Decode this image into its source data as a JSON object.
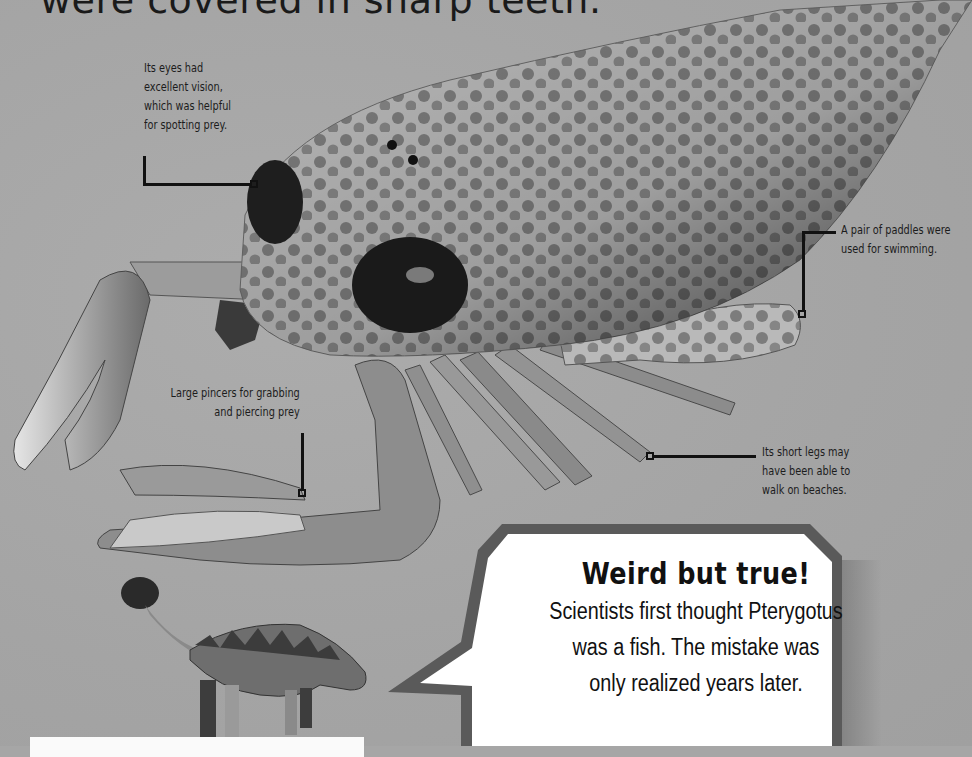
{
  "page": {
    "title_fragment": "were covered in sharp teeth.",
    "background_color": "#a6a6a6"
  },
  "illustration": {
    "subject": "Pterygotus sea scorpion",
    "secondary_subject": "armored dinosaur (ankylosaur)"
  },
  "callouts": [
    {
      "id": "eyes",
      "lines": [
        "Its eyes had",
        "excellent vision,",
        "which was helpful",
        "for spotting prey."
      ]
    },
    {
      "id": "paddles",
      "lines": [
        "A pair of paddles were",
        "used for swimming."
      ]
    },
    {
      "id": "pincers",
      "lines": [
        "Large pincers for grabbing",
        "and piercing prey"
      ]
    },
    {
      "id": "legs",
      "lines": [
        "Its short legs may",
        "have been able to",
        "walk on beaches."
      ]
    }
  ],
  "speech_bubble": {
    "heading": "Weird but true!",
    "lines": [
      "Scientists first thought Pterygotus",
      "was a fish. The mistake was",
      "only realized years later."
    ],
    "border_color": "#5a5a5a",
    "fill_color": "#ffffff"
  }
}
